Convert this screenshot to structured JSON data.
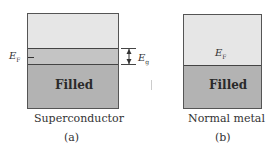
{
  "figure": {
    "panel_a": {
      "title": "Superconductor",
      "caption": "(a)",
      "filled_label": "Filled",
      "fermi_label": "E",
      "fermi_sub": "F",
      "gap_label": "E",
      "gap_sub": "g"
    },
    "panel_b": {
      "title": "Normal metal",
      "caption": "(b)",
      "filled_label": "Filled",
      "fermi_label": "E",
      "fermi_sub": "F"
    },
    "colors": {
      "empty": "#e6e6e6",
      "gap_band": "#c4c4c4",
      "filled": "#b3b3b3",
      "lines": "#444444"
    }
  }
}
